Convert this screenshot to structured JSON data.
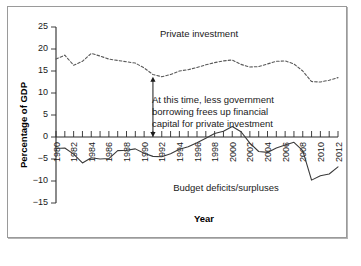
{
  "figure": {
    "frame_color": "#9a9a9a",
    "background": "#ffffff"
  },
  "chart_data": {
    "type": "line",
    "title": "",
    "xlabel": "Year",
    "ylabel": "Percentage of GDP",
    "xlim": [
      1980,
      2012
    ],
    "ylim": [
      -15,
      25
    ],
    "yticks": [
      25,
      20,
      15,
      10,
      5,
      0,
      -5,
      -10,
      -15
    ],
    "ytick_labels": [
      "25",
      "20",
      "15",
      "10",
      "5",
      "0",
      "−5",
      "−10",
      "−15"
    ],
    "xticks": [
      1980,
      1982,
      1984,
      1986,
      1988,
      1990,
      1992,
      1994,
      1996,
      1998,
      2000,
      2002,
      2004,
      2006,
      2008,
      2010,
      2012
    ],
    "xtick_labels": [
      "1980",
      "1982",
      "1984",
      "1986",
      "1988",
      "1990",
      "1992",
      "1994",
      "1996",
      "1998",
      "2000",
      "2002",
      "2004",
      "2006",
      "2008",
      "2010",
      "2012"
    ],
    "xtick_minor_step": 1,
    "grid": false,
    "legend_position": "inline-labels",
    "x": [
      1980,
      1981,
      1982,
      1983,
      1984,
      1985,
      1986,
      1987,
      1988,
      1989,
      1990,
      1991,
      1992,
      1993,
      1994,
      1995,
      1996,
      1997,
      1998,
      1999,
      2000,
      2001,
      2002,
      2003,
      2004,
      2005,
      2006,
      2007,
      2008,
      2009,
      2010,
      2011,
      2012
    ],
    "series": [
      {
        "name": "Private investment",
        "style": "dashed",
        "color": "#595959",
        "label_text": "Private investment",
        "values": [
          17.7,
          18.6,
          16.3,
          17.2,
          19.0,
          18.4,
          17.7,
          17.4,
          17.1,
          16.8,
          15.7,
          14.2,
          13.7,
          14.2,
          15.0,
          15.3,
          15.8,
          16.4,
          16.9,
          17.3,
          17.5,
          16.5,
          15.9,
          16.0,
          16.6,
          17.2,
          17.3,
          16.6,
          15.0,
          12.6,
          12.5,
          12.9,
          13.5
        ]
      },
      {
        "name": "Budget deficits/surpluses",
        "style": "solid",
        "color": "#3a3a3a",
        "label_text": "Budget deficits/surpluses",
        "values": [
          -2.6,
          -2.5,
          -3.9,
          -5.9,
          -4.7,
          -5.0,
          -4.9,
          -3.1,
          -3.0,
          -2.7,
          -3.7,
          -4.4,
          -4.5,
          -3.8,
          -2.8,
          -2.2,
          -1.3,
          -0.3,
          0.8,
          1.3,
          2.4,
          1.2,
          -1.4,
          -3.3,
          -3.5,
          -2.5,
          -1.8,
          -1.2,
          -3.1,
          -9.8,
          -8.8,
          -8.4,
          -6.8
        ]
      }
    ],
    "annotations": [
      {
        "type": "text-block",
        "lines": [
          "At this time, less government",
          "borrowing frees up financial",
          "capital for private investment"
        ]
      },
      {
        "type": "double-arrow",
        "at_year": 1991,
        "from_value": 13.7,
        "to_value": 0.0
      }
    ]
  }
}
